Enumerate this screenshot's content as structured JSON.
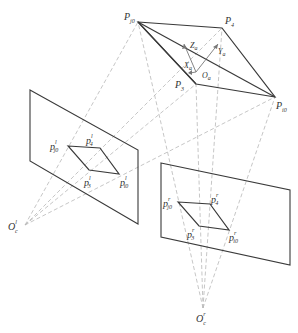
{
  "diagram": {
    "type": "stereo-camera-projection",
    "object_points": {
      "Pj0": {
        "label": "P",
        "sub": "j0",
        "x": 138,
        "y": 22
      },
      "P4": {
        "label": "P",
        "sub": "4",
        "x": 222,
        "y": 28
      },
      "Pi0": {
        "label": "P",
        "sub": "i0",
        "x": 275,
        "y": 97
      },
      "P3": {
        "label": "P",
        "sub": "3",
        "x": 196,
        "y": 84
      }
    },
    "object_axes": {
      "origin": {
        "label": "O",
        "sub": "a",
        "x": 196,
        "y": 72
      },
      "Z": {
        "label": "Z",
        "sub": "a"
      },
      "Y": {
        "label": "Y",
        "sub": "a"
      },
      "X": {
        "label": "X",
        "sub": "a"
      }
    },
    "left_camera": {
      "center": {
        "label": "O",
        "sup": "l",
        "sub": "c",
        "x": 25,
        "y": 225
      },
      "plane": [
        [
          30,
          90
        ],
        [
          138,
          150
        ],
        [
          138,
          224
        ],
        [
          30,
          161
        ]
      ],
      "image_points": {
        "pj0": {
          "label": "p",
          "sup": "l",
          "sub": "j0",
          "x": 68,
          "y": 146
        },
        "p4": {
          "label": "p",
          "sup": "l",
          "sub": "4",
          "x": 100,
          "y": 148
        },
        "pi0": {
          "label": "p",
          "sup": "l",
          "sub": "i0",
          "x": 119,
          "y": 174
        },
        "p3": {
          "label": "p",
          "sup": "l",
          "sub": "3",
          "x": 89,
          "y": 170
        }
      }
    },
    "right_camera": {
      "center": {
        "label": "O",
        "sup": "r",
        "sub": "c",
        "x": 203,
        "y": 308
      },
      "plane": [
        [
          161,
          163
        ],
        [
          290,
          190
        ],
        [
          290,
          265
        ],
        [
          161,
          237
        ]
      ],
      "image_points": {
        "pj0": {
          "label": "p",
          "sup": "r",
          "sub": "j0",
          "x": 178,
          "y": 202
        },
        "p4": {
          "label": "p",
          "sup": "r",
          "sub": "4",
          "x": 210,
          "y": 204
        },
        "pi0": {
          "label": "p",
          "sup": "r",
          "sub": "i0",
          "x": 229,
          "y": 230
        },
        "p3": {
          "label": "p",
          "sup": "r",
          "sub": "3",
          "x": 199,
          "y": 226
        }
      }
    },
    "colors": {
      "solid_line": "#3a3a3a",
      "dashed_line": "#b8b8b8",
      "axis_line": "#777777"
    }
  }
}
